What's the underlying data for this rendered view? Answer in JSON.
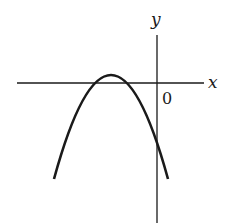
{
  "figure": {
    "type": "function-graph",
    "colors": {
      "background": "#ffffff",
      "ink": "#1a1a1a"
    },
    "axes": {
      "x_label": "x",
      "y_label": "y",
      "origin_label": "0"
    },
    "curve": {
      "kind": "parabola",
      "opens": "down",
      "vertex_quadrant": "II",
      "x_intercepts_sign": "both negative",
      "y_intercept_sign": "negative"
    }
  }
}
